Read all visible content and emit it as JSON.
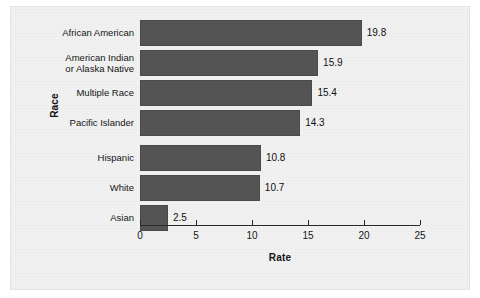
{
  "chart_data": {
    "type": "bar",
    "orientation": "horizontal",
    "title": "",
    "xlabel": "Rate",
    "ylabel": "Race",
    "categories": [
      "African American",
      "American Indian\nor Alaska Native",
      "Multiple Race",
      "Pacific Islander",
      "Hispanic",
      "White",
      "Asian"
    ],
    "values": [
      19.8,
      15.9,
      15.4,
      14.3,
      10.8,
      10.7,
      2.5
    ],
    "data_labels": [
      "19.8",
      "15.9",
      "15.4",
      "14.3",
      "10.8",
      "10.7",
      "2.5"
    ],
    "xlim": [
      0,
      25
    ],
    "xticks": [
      0,
      5,
      10,
      15,
      20,
      25
    ],
    "xtick_labels": [
      "0",
      "5",
      "10",
      "15",
      "20",
      "25"
    ],
    "grid": false,
    "legend": null,
    "bar_color": "#545454",
    "background_color": "#f1f1f1",
    "text_color": "#141414"
  }
}
